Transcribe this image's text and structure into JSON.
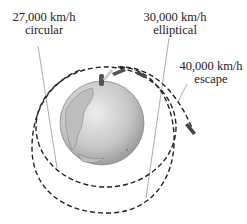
{
  "diagram": {
    "labels": [
      {
        "speed": "27,000 km/h",
        "type": "circular"
      },
      {
        "speed": "30,000 km/h",
        "type": "elliptical"
      },
      {
        "speed": "40,000 km/h",
        "type": "escape"
      }
    ],
    "icons": {
      "earth": "earth-globe-icon",
      "rocket": "rocket-icon"
    },
    "colors": {
      "orbit_line": "#222222",
      "leader_line": "#8a8a8a",
      "globe_light": "#e6e6e6",
      "globe_dark": "#9a9a9a"
    }
  }
}
